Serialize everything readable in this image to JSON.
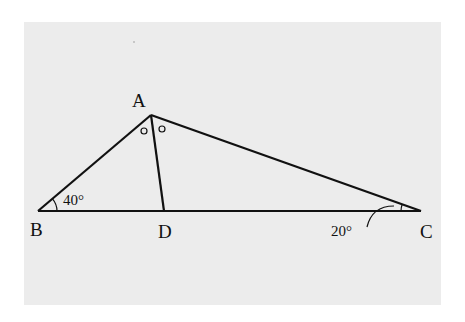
{
  "diagram": {
    "type": "triangle-with-angle-bisector",
    "points": {
      "A": {
        "label": "A",
        "x": 151,
        "y": 115
      },
      "B": {
        "label": "B",
        "x": 38,
        "y": 211
      },
      "C": {
        "label": "C",
        "x": 421,
        "y": 211
      },
      "D": {
        "label": "D",
        "x": 164,
        "y": 211
      }
    },
    "segments": [
      "AB",
      "AC",
      "BC",
      "AD"
    ],
    "angles": {
      "B": {
        "label": "40°"
      },
      "C": {
        "label": "20°"
      },
      "BAD_mark": "o",
      "DAC_mark": "o"
    },
    "colors": {
      "background": "#ececec",
      "line": "#111111"
    }
  }
}
